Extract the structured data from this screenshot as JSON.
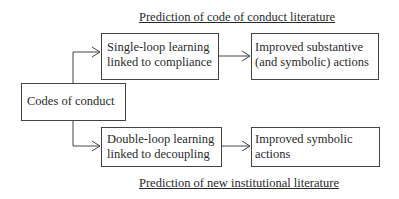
{
  "diagram": {
    "top_caption": "Prediction of code of conduct literature",
    "bottom_caption": "Prediction of new institutional literature",
    "source_node": {
      "label": "Codes of conduct"
    },
    "top_branch": {
      "step": {
        "line1": "Single-loop learning",
        "line2": "linked to compliance"
      },
      "outcome": {
        "line1": "Improved substantive",
        "line2": "(and symbolic) actions"
      }
    },
    "bottom_branch": {
      "step": {
        "line1": "Double-loop learning",
        "line2": "linked to decoupling"
      },
      "outcome": {
        "line1": "Improved symbolic",
        "line2": "actions"
      }
    },
    "colors": {
      "line": "#444444",
      "text": "#2a2a2a",
      "background": "#ffffff"
    }
  }
}
